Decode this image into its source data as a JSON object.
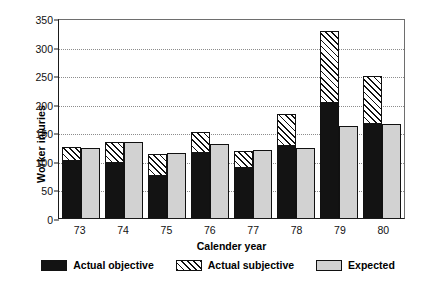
{
  "chart_data": {
    "type": "bar",
    "title": "",
    "subtitle": "",
    "xlabel": "Calender year",
    "ylabel": "Worker injuries",
    "categories": [
      "73",
      "74",
      "75",
      "76",
      "77",
      "78",
      "79",
      "80"
    ],
    "ylim": [
      0,
      350
    ],
    "yticks": [
      0,
      50,
      100,
      150,
      200,
      250,
      300,
      350
    ],
    "grid": "horizontal-dotted",
    "legend_position": "bottom-center",
    "series": [
      {
        "name": "Actual objective",
        "color": "#131313",
        "values": [
          102,
          98,
          75,
          116,
          90,
          128,
          203,
          166
        ]
      },
      {
        "name": "Actual subjective",
        "color": "#ffffff",
        "pattern": "diagonal-hatch",
        "note": "stacked on top of Actual objective; values are group totals",
        "values": [
          125,
          133,
          112,
          151,
          118,
          182,
          327,
          249
        ]
      },
      {
        "name": "Expected",
        "color": "#d2d2d2",
        "values": [
          123,
          133,
          113,
          129,
          119,
          122,
          161,
          165
        ]
      }
    ]
  },
  "axis": {
    "y_label": "Worker injuries",
    "x_label": "Calender year",
    "y_ticks": [
      "0",
      "50",
      "100",
      "150",
      "200",
      "250",
      "300",
      "350"
    ],
    "x_ticks": [
      "73",
      "74",
      "75",
      "76",
      "77",
      "78",
      "79",
      "80"
    ]
  },
  "legend": {
    "items": [
      {
        "label": "Actual objective",
        "swatch": "solid-black-swatch"
      },
      {
        "label": "Actual subjective",
        "swatch": "hatched-swatch"
      },
      {
        "label": "Expected",
        "swatch": "light-gray-swatch"
      }
    ]
  }
}
